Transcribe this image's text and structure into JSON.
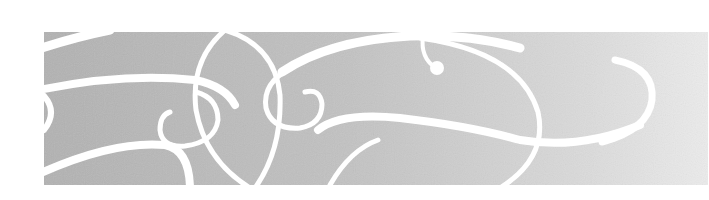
{
  "banner": {
    "description": "Decorative gray banner with white ornamental swirls",
    "colors": {
      "background": "#ffffff",
      "band_left": "#b4b4b4",
      "band_right": "#e8e8e8",
      "swirl": "#ffffff"
    }
  }
}
